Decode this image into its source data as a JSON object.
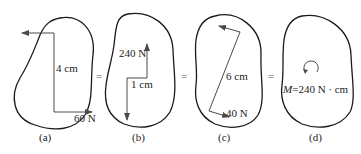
{
  "panels": [
    {
      "id": "a",
      "caption": "(a)",
      "distance_label": "4 cm",
      "force_label": "60 N"
    },
    {
      "id": "b",
      "caption": "(b)",
      "distance_label": "1 cm",
      "force_label": "240 N"
    },
    {
      "id": "c",
      "caption": "(c)",
      "distance_label": "6 cm",
      "force_label": "40 N"
    },
    {
      "id": "d",
      "caption": "(d)",
      "moment_symbol": "M",
      "moment_value": "=240 N · cm"
    }
  ],
  "equals": [
    "=",
    "=",
    "="
  ],
  "colors": {
    "outline": "#1a1a1a",
    "force_line": "#4a4a4a",
    "text": "#222222"
  }
}
